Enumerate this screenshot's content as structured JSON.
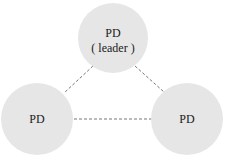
{
  "diagram": {
    "colors": {
      "node_fill": "#e6e6e6",
      "edge": "#777777",
      "text": "#1a1a1a"
    },
    "nodes": [
      {
        "id": "top",
        "label": "PD",
        "sublabel": "( leader )",
        "role": "leader"
      },
      {
        "id": "left",
        "label": "PD"
      },
      {
        "id": "right",
        "label": "PD"
      }
    ],
    "edges": [
      {
        "from": "top",
        "to": "left",
        "style": "dashed"
      },
      {
        "from": "top",
        "to": "right",
        "style": "dashed"
      },
      {
        "from": "left",
        "to": "right",
        "style": "dashed"
      }
    ]
  }
}
